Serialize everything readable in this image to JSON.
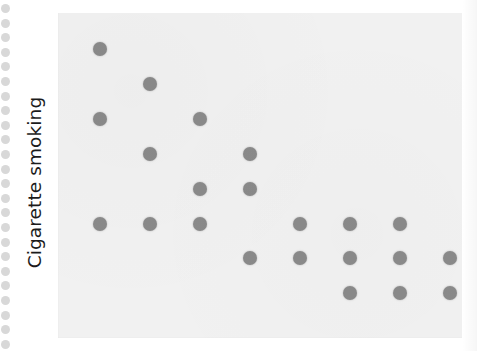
{
  "figure": {
    "y_axis_label": "Cigarette smoking",
    "panel_background_color": "#f1f1f1",
    "marker_color": "#8a8a8a",
    "page_background_color": "#ffffff"
  },
  "binding": {
    "name": "spiral-binding-holes",
    "hole_color": "#d8d8d8",
    "hole_count": 24,
    "first_hole_y": 4,
    "hole_spacing": 14.6
  },
  "chart_data": {
    "type": "scatter",
    "title": "",
    "subtitle": "",
    "xlabel": "",
    "ylabel": "Cigarette smoking",
    "xticklabels": [],
    "yticklabels": [],
    "grid": false,
    "legend": null,
    "annotations": [],
    "xlim": [
      0,
      404
    ],
    "ylim": [
      0,
      325
    ],
    "note": "Ordinal ranked scatter; x and y positions given in panel pixel coordinates (origin at panel top-left, y increasing downward). No tick labels are printed on the figure.",
    "x_column_positions": [
      42,
      92,
      142,
      192,
      242,
      292,
      342,
      392
    ],
    "y_row_positions": [
      36,
      71,
      106,
      141,
      176,
      211,
      245,
      280
    ],
    "points": [
      {
        "x": 42,
        "y": 36
      },
      {
        "x": 92,
        "y": 71
      },
      {
        "x": 42,
        "y": 106
      },
      {
        "x": 142,
        "y": 106
      },
      {
        "x": 92,
        "y": 141
      },
      {
        "x": 192,
        "y": 141
      },
      {
        "x": 142,
        "y": 176
      },
      {
        "x": 192,
        "y": 176
      },
      {
        "x": 42,
        "y": 211
      },
      {
        "x": 92,
        "y": 211
      },
      {
        "x": 142,
        "y": 211
      },
      {
        "x": 242,
        "y": 211
      },
      {
        "x": 292,
        "y": 211
      },
      {
        "x": 342,
        "y": 211
      },
      {
        "x": 192,
        "y": 245
      },
      {
        "x": 242,
        "y": 245
      },
      {
        "x": 292,
        "y": 245
      },
      {
        "x": 342,
        "y": 245
      },
      {
        "x": 392,
        "y": 245
      },
      {
        "x": 292,
        "y": 280
      },
      {
        "x": 342,
        "y": 280
      },
      {
        "x": 392,
        "y": 280
      }
    ]
  }
}
